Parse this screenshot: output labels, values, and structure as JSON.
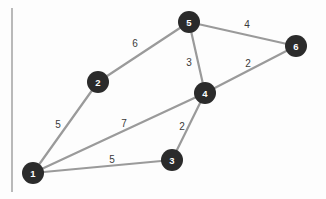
{
  "chart_data": {
    "type": "diagram",
    "diagram_kind": "weighted-undirected-graph",
    "title": "",
    "background_color": "#fdfdfd",
    "node_color": "#2b2b2b",
    "node_label_color": "#ffffff",
    "edge_color": "#9a9a9a",
    "edge_weight_color": "#3a3a3a",
    "axis_color": "#a8a8a8",
    "node_radius": 11,
    "nodes": [
      {
        "id": "1",
        "label": "1",
        "x": 33,
        "y": 173
      },
      {
        "id": "2",
        "label": "2",
        "x": 98,
        "y": 82
      },
      {
        "id": "3",
        "label": "3",
        "x": 172,
        "y": 160
      },
      {
        "id": "4",
        "label": "4",
        "x": 205,
        "y": 93
      },
      {
        "id": "5",
        "label": "5",
        "x": 189,
        "y": 22
      },
      {
        "id": "6",
        "label": "6",
        "x": 296,
        "y": 46
      }
    ],
    "edges": [
      {
        "source": "1",
        "target": "2",
        "weight": 5,
        "label": "5",
        "label_x": 58,
        "label_y": 124
      },
      {
        "source": "1",
        "target": "4",
        "weight": 7,
        "label": "7",
        "label_x": 124,
        "label_y": 123
      },
      {
        "source": "1",
        "target": "3",
        "weight": 5,
        "label": "5",
        "label_x": 112,
        "label_y": 159
      },
      {
        "source": "2",
        "target": "5",
        "weight": 6,
        "label": "6",
        "label_x": 135,
        "label_y": 43
      },
      {
        "source": "3",
        "target": "4",
        "weight": 2,
        "label": "2",
        "label_x": 182,
        "label_y": 126
      },
      {
        "source": "4",
        "target": "5",
        "weight": 3,
        "label": "3",
        "label_x": 189,
        "label_y": 62
      },
      {
        "source": "4",
        "target": "6",
        "weight": 2,
        "label": "2",
        "label_x": 248,
        "label_y": 63
      },
      {
        "source": "5",
        "target": "6",
        "weight": 4,
        "label": "4",
        "label_x": 247,
        "label_y": 24
      }
    ],
    "axis": {
      "x": 12,
      "y1": 8,
      "y2": 192
    }
  }
}
